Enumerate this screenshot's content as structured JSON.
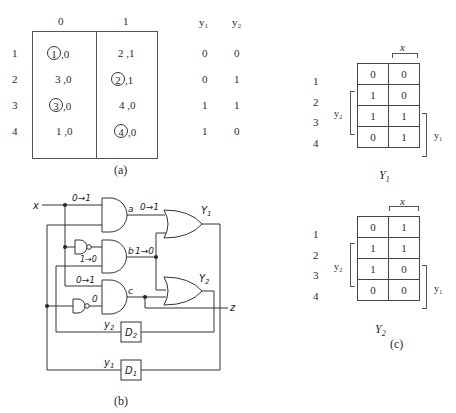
{
  "part_a": {
    "caption": "(a)",
    "column_headers": [
      "0",
      "1"
    ],
    "output_headers": [
      "y₁",
      "y₂"
    ],
    "rows": [
      {
        "state": "1",
        "col0": {
          "next": "1",
          "circled": true,
          "out": ",0"
        },
        "col1": {
          "next": "2",
          "circled": false,
          "out": ",1"
        },
        "y1": "0",
        "y2": "0"
      },
      {
        "state": "2",
        "col0": {
          "next": "3",
          "circled": false,
          "out": ",0"
        },
        "col1": {
          "next": "2",
          "circled": true,
          "out": ",1"
        },
        "y1": "0",
        "y2": "1"
      },
      {
        "state": "3",
        "col0": {
          "next": "3",
          "circled": true,
          "out": ",0"
        },
        "col1": {
          "next": "4",
          "circled": false,
          "out": ",0"
        },
        "y1": "1",
        "y2": "1"
      },
      {
        "state": "4",
        "col0": {
          "next": "1",
          "circled": false,
          "out": ",0"
        },
        "col1": {
          "next": "4",
          "circled": true,
          "out": ",0"
        },
        "y1": "1",
        "y2": "0"
      }
    ]
  },
  "part_b": {
    "caption": "(b)",
    "input_label": "x",
    "output_label": "z",
    "gate_labels": {
      "a": "a",
      "b": "b",
      "c": "c",
      "Y1": "Y",
      "Y1_sub": "1",
      "Y2": "Y",
      "Y2_sub": "2"
    },
    "transitions": {
      "x_in": "0→1",
      "a_out": "0→1",
      "inv_out": "1→0",
      "b_out": "1→0",
      "c_in": "0→1",
      "inv2_out": "0"
    },
    "flipflops": [
      {
        "name": "D",
        "sub": "2",
        "output": "y",
        "output_sub": "2"
      },
      {
        "name": "D",
        "sub": "1",
        "output": "y",
        "output_sub": "1"
      }
    ]
  },
  "part_c": {
    "caption": "(c)",
    "maps": [
      {
        "title": "Y",
        "title_sub": "1",
        "row_labels": [
          "1",
          "2",
          "3",
          "4"
        ],
        "col_var": "x",
        "row_var_left": "y₂",
        "row_var_right": "y₁",
        "cells": [
          [
            "0",
            "0"
          ],
          [
            "1",
            "0"
          ],
          [
            "1",
            "1"
          ],
          [
            "0",
            "1"
          ]
        ]
      },
      {
        "title": "Y",
        "title_sub": "2",
        "row_labels": [
          "1",
          "2",
          "3",
          "4"
        ],
        "col_var": "x",
        "row_var_left": "y₂",
        "row_var_right": "y₁",
        "cells": [
          [
            "0",
            "1"
          ],
          [
            "1",
            "1"
          ],
          [
            "1",
            "0"
          ],
          [
            "0",
            "0"
          ]
        ]
      }
    ]
  }
}
